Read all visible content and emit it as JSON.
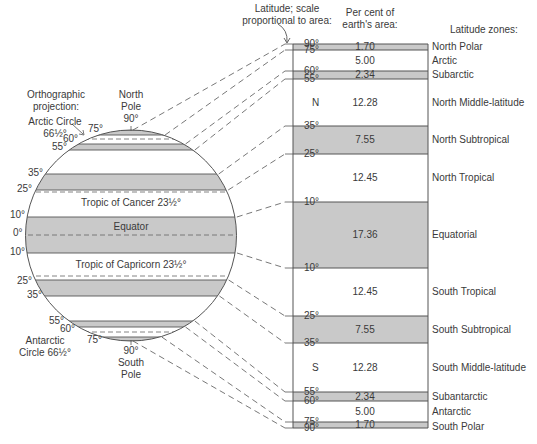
{
  "headers": {
    "latitude_scale_line1": "Latitude; scale",
    "latitude_scale_line2": "proportional to area:",
    "percent_line1": "Per cent of",
    "percent_line2": "earth's area:",
    "zones": "Latitude zones:",
    "projection_line1": "Orthographic",
    "projection_line2": "projection:"
  },
  "globe_labels": {
    "north_pole": [
      "North",
      "Pole",
      "90°"
    ],
    "south_pole": [
      "90°",
      "South",
      "Pole"
    ],
    "arctic_circle": [
      "Arctic Circle",
      "66½°"
    ],
    "antarctic_circle": [
      "Antarctic",
      "Circle 66½°"
    ],
    "tropic_cancer": "Tropic of Cancer 23½°",
    "tropic_capricorn": "Tropic of Capricorn 23½°",
    "equator": "Equator",
    "lat_ticks": [
      {
        "label": "75°",
        "x": 88,
        "y": 133
      },
      {
        "label": "60°",
        "x": 63,
        "y": 143
      },
      {
        "label": "55°",
        "x": 52,
        "y": 151
      },
      {
        "label": "35°",
        "x": 28,
        "y": 177
      },
      {
        "label": "25°",
        "x": 17,
        "y": 193
      },
      {
        "label": "10°",
        "x": 10,
        "y": 219
      },
      {
        "label": "0°",
        "x": 13,
        "y": 237
      },
      {
        "label": "10°",
        "x": 10,
        "y": 256
      },
      {
        "label": "25°",
        "x": 17,
        "y": 285
      },
      {
        "label": "35°",
        "x": 27,
        "y": 299
      },
      {
        "label": "55°",
        "x": 49,
        "y": 325
      },
      {
        "label": "60°",
        "x": 60,
        "y": 333
      },
      {
        "label": "75°",
        "x": 87,
        "y": 344
      }
    ]
  },
  "chart_data": {
    "type": "table",
    "columns": [
      "Latitude range",
      "Per cent of earth's area",
      "Latitude zone"
    ],
    "zones": [
      {
        "from": "90°",
        "to": "75°",
        "hemisphere": "",
        "percent": "1.70",
        "zone": "North Polar",
        "shaded": true
      },
      {
        "from": "75°",
        "to": "60°",
        "hemisphere": "",
        "percent": "5.00",
        "zone": "Arctic",
        "shaded": false
      },
      {
        "from": "60°",
        "to": "55°",
        "hemisphere": "",
        "percent": "2.34",
        "zone": "Subarctic",
        "shaded": true
      },
      {
        "from": "55°",
        "to": "35°",
        "hemisphere": "N",
        "percent": "12.28",
        "zone": "North Middle-latitude",
        "shaded": false
      },
      {
        "from": "35°",
        "to": "25°",
        "hemisphere": "",
        "percent": "7.55",
        "zone": "North Subtropical",
        "shaded": true
      },
      {
        "from": "25°",
        "to": "10°",
        "hemisphere": "",
        "percent": "12.45",
        "zone": "North Tropical",
        "shaded": false
      },
      {
        "from": "10°",
        "to": "10°",
        "hemisphere": "",
        "percent": "17.36",
        "zone": "Equatorial",
        "shaded": true
      },
      {
        "from": "10°",
        "to": "25°",
        "hemisphere": "",
        "percent": "12.45",
        "zone": "South Tropical",
        "shaded": false
      },
      {
        "from": "25°",
        "to": "35°",
        "hemisphere": "",
        "percent": "7.55",
        "zone": "South Subtropical",
        "shaded": true
      },
      {
        "from": "35°",
        "to": "55°",
        "hemisphere": "S",
        "percent": "12.28",
        "zone": "South Middle-latitude",
        "shaded": false
      },
      {
        "from": "55°",
        "to": "60°",
        "hemisphere": "",
        "percent": "2.34",
        "zone": "Subantarctic",
        "shaded": true
      },
      {
        "from": "60°",
        "to": "75°",
        "hemisphere": "",
        "percent": "5.00",
        "zone": "Antarctic",
        "shaded": false
      },
      {
        "from": "75°",
        "to": "90°",
        "hemisphere": "",
        "percent": "1.70",
        "zone": "South Polar",
        "shaded": true
      }
    ],
    "boundaries": [
      {
        "label": "90°",
        "y": 44
      },
      {
        "label": "75°",
        "y": 50
      },
      {
        "label": "60°",
        "y": 71
      },
      {
        "label": "55°",
        "y": 79
      },
      {
        "label": "35°",
        "y": 126
      },
      {
        "label": "25°",
        "y": 154
      },
      {
        "label": "10°",
        "y": 202
      },
      {
        "label": "10°",
        "y": 268
      },
      {
        "label": "25°",
        "y": 316
      },
      {
        "label": "35°",
        "y": 343
      },
      {
        "label": "55°",
        "y": 392
      },
      {
        "label": "60°",
        "y": 401
      },
      {
        "label": "75°",
        "y": 422
      },
      {
        "label": "90°",
        "y": 428
      }
    ],
    "globe_boundaries_y": [
      130,
      135,
      144,
      150,
      174,
      190,
      217,
      253,
      280,
      296,
      321,
      327,
      337,
      341
    ],
    "total_percent": 100
  },
  "colors": {
    "shade": "#c9c9c9",
    "line": "#555555",
    "text": "#3a3a3a"
  }
}
